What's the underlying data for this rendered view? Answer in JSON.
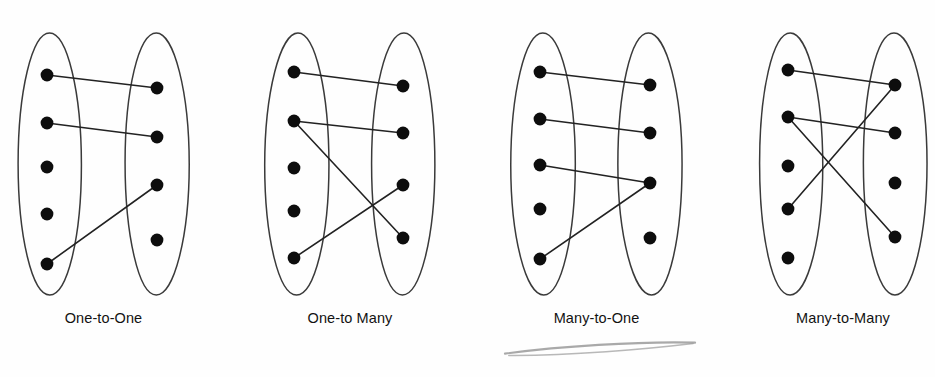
{
  "figure": {
    "background_color": "#fefefe",
    "ellipse_stroke": "#3a3a3a",
    "dot_color": "#0d0d0d",
    "line_color": "#222222",
    "label_color": "#121212",
    "scribble_color": "#9a9a9a"
  },
  "panels": [
    {
      "id": "one-to-one",
      "label": "One-to-One",
      "left_set": {
        "name": "left-set",
        "dot_count": 5,
        "dots": [
          {
            "id": "L1",
            "cx": 47,
            "cy": 75
          },
          {
            "id": "L2",
            "cx": 47,
            "cy": 123
          },
          {
            "id": "L3",
            "cx": 47,
            "cy": 167
          },
          {
            "id": "L4",
            "cx": 47,
            "cy": 214
          },
          {
            "id": "L5",
            "cx": 47,
            "cy": 264
          }
        ],
        "ellipse": {
          "cx": 50,
          "cy": 164,
          "rx": 32,
          "ry": 131
        }
      },
      "right_set": {
        "name": "right-set",
        "dot_count": 4,
        "dots": [
          {
            "id": "R1",
            "cx": 157,
            "cy": 88
          },
          {
            "id": "R2",
            "cx": 157,
            "cy": 137
          },
          {
            "id": "R3",
            "cx": 157,
            "cy": 185
          },
          {
            "id": "R4",
            "cx": 157,
            "cy": 240
          }
        ],
        "ellipse": {
          "cx": 157,
          "cy": 164,
          "rx": 32,
          "ry": 131
        }
      },
      "links": [
        {
          "from": "L1",
          "to": "R1"
        },
        {
          "from": "L2",
          "to": "R2"
        },
        {
          "from": "L5",
          "to": "R3"
        }
      ]
    },
    {
      "id": "one-to-many",
      "label": "One-to Many",
      "left_set": {
        "name": "left-set",
        "dot_count": 5,
        "dots": [
          {
            "id": "L1",
            "cx": 294,
            "cy": 72
          },
          {
            "id": "L2",
            "cx": 294,
            "cy": 121
          },
          {
            "id": "L3",
            "cx": 294,
            "cy": 168
          },
          {
            "id": "L4",
            "cx": 294,
            "cy": 211
          },
          {
            "id": "L5",
            "cx": 294,
            "cy": 258
          }
        ],
        "ellipse": {
          "cx": 297,
          "cy": 164,
          "rx": 32,
          "ry": 131
        }
      },
      "right_set": {
        "name": "right-set",
        "dot_count": 4,
        "dots": [
          {
            "id": "R1",
            "cx": 403,
            "cy": 86
          },
          {
            "id": "R2",
            "cx": 403,
            "cy": 133
          },
          {
            "id": "R3",
            "cx": 403,
            "cy": 185
          },
          {
            "id": "R4",
            "cx": 403,
            "cy": 238
          }
        ],
        "ellipse": {
          "cx": 403,
          "cy": 164,
          "rx": 32,
          "ry": 131
        }
      },
      "links": [
        {
          "from": "L1",
          "to": "R1"
        },
        {
          "from": "L2",
          "to": "R2"
        },
        {
          "from": "L2",
          "to": "R4"
        },
        {
          "from": "L5",
          "to": "R3"
        }
      ]
    },
    {
      "id": "many-to-one",
      "label": "Many-to-One",
      "left_set": {
        "name": "left-set",
        "dot_count": 5,
        "dots": [
          {
            "id": "L1",
            "cx": 540,
            "cy": 72
          },
          {
            "id": "L2",
            "cx": 540,
            "cy": 119
          },
          {
            "id": "L3",
            "cx": 540,
            "cy": 165
          },
          {
            "id": "L4",
            "cx": 540,
            "cy": 209
          },
          {
            "id": "L5",
            "cx": 540,
            "cy": 259
          }
        ],
        "ellipse": {
          "cx": 543,
          "cy": 164,
          "rx": 32,
          "ry": 131
        }
      },
      "right_set": {
        "name": "right-set",
        "dot_count": 4,
        "dots": [
          {
            "id": "R1",
            "cx": 650,
            "cy": 85
          },
          {
            "id": "R2",
            "cx": 650,
            "cy": 133
          },
          {
            "id": "R3",
            "cx": 650,
            "cy": 183
          },
          {
            "id": "R4",
            "cx": 650,
            "cy": 238
          }
        ],
        "ellipse": {
          "cx": 650,
          "cy": 164,
          "rx": 32,
          "ry": 131
        }
      },
      "links": [
        {
          "from": "L1",
          "to": "R1"
        },
        {
          "from": "L2",
          "to": "R2"
        },
        {
          "from": "L3",
          "to": "R3"
        },
        {
          "from": "L5",
          "to": "R3"
        }
      ]
    },
    {
      "id": "many-to-many",
      "label": "Many-to-Many",
      "left_set": {
        "name": "left-set",
        "dot_count": 5,
        "dots": [
          {
            "id": "L1",
            "cx": 788,
            "cy": 70
          },
          {
            "id": "L2",
            "cx": 788,
            "cy": 117
          },
          {
            "id": "L3",
            "cx": 788,
            "cy": 166
          },
          {
            "id": "L4",
            "cx": 788,
            "cy": 209
          },
          {
            "id": "L5",
            "cx": 788,
            "cy": 258
          }
        ],
        "ellipse": {
          "cx": 791,
          "cy": 164,
          "rx": 32,
          "ry": 131
        }
      },
      "right_set": {
        "name": "right-set",
        "dot_count": 4,
        "dots": [
          {
            "id": "R1",
            "cx": 895,
            "cy": 85
          },
          {
            "id": "R2",
            "cx": 895,
            "cy": 133
          },
          {
            "id": "R3",
            "cx": 895,
            "cy": 183
          },
          {
            "id": "R4",
            "cx": 895,
            "cy": 237
          }
        ],
        "ellipse": {
          "cx": 895,
          "cy": 164,
          "rx": 32,
          "ry": 131
        }
      },
      "links": [
        {
          "from": "L1",
          "to": "R1"
        },
        {
          "from": "L2",
          "to": "R2"
        },
        {
          "from": "L2",
          "to": "R4"
        },
        {
          "from": "L4",
          "to": "R1"
        }
      ]
    }
  ],
  "annotations": [
    {
      "id": "pencil-scribble",
      "kind": "handwritten-stroke",
      "x": 505,
      "y": 340,
      "width": 190,
      "height": 22
    }
  ]
}
